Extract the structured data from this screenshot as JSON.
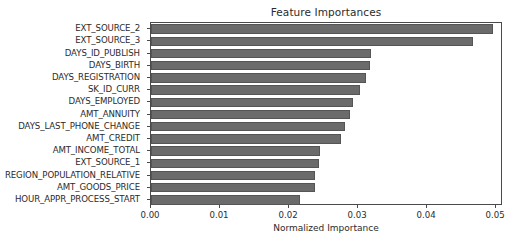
{
  "chart_data": {
    "type": "bar",
    "orientation": "horizontal",
    "title": "Feature Importances",
    "xlabel": "Normalized Importance",
    "ylabel": "",
    "xlim": [
      0.0,
      0.051
    ],
    "xticks": [
      0.0,
      0.01,
      0.02,
      0.03,
      0.04,
      0.05
    ],
    "xtick_labels": [
      "0.00",
      "0.01",
      "0.02",
      "0.03",
      "0.04",
      "0.05"
    ],
    "grid": false,
    "legend": false,
    "bar_color": "#6b6b6b",
    "bar_edge_color": "#555555",
    "categories": [
      "EXT_SOURCE_2",
      "EXT_SOURCE_3",
      "DAYS_ID_PUBLISH",
      "DAYS_BIRTH",
      "DAYS_REGISTRATION",
      "SK_ID_CURR",
      "DAYS_EMPLOYED",
      "AMT_ANNUITY",
      "DAYS_LAST_PHONE_CHANGE",
      "AMT_CREDIT",
      "AMT_INCOME_TOTAL",
      "EXT_SOURCE_1",
      "REGION_POPULATION_RELATIVE",
      "AMT_GOODS_PRICE",
      "HOUR_APPR_PROCESS_START"
    ],
    "values": [
      0.0496,
      0.0467,
      0.0319,
      0.0318,
      0.0312,
      0.0303,
      0.0292,
      0.0289,
      0.0281,
      0.0275,
      0.0245,
      0.0243,
      0.0238,
      0.0237,
      0.0216
    ]
  }
}
